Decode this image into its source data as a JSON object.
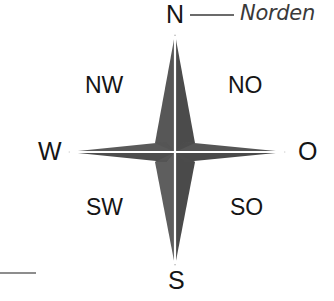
{
  "figure": {
    "kind": "compass-rose",
    "language": "de",
    "background_color": "#ffffff",
    "star": {
      "fill_dark": "#4f4f4f",
      "fill_light": "#6a6a6a",
      "center_x": 175,
      "center_y": 152,
      "tip_north_y": 34,
      "tip_south_y": 266,
      "tip_west_x": 68,
      "tip_east_x": 286,
      "points": 4
    },
    "cardinal_labels": [
      {
        "key": "north",
        "text": "N",
        "degrees": 0
      },
      {
        "key": "east",
        "text": "O",
        "degrees": 90
      },
      {
        "key": "south",
        "text": "S",
        "degrees": 180
      },
      {
        "key": "west",
        "text": "W",
        "degrees": 270
      }
    ],
    "ordinal_labels": [
      {
        "key": "northwest",
        "text": "NW",
        "degrees": 315
      },
      {
        "key": "northeast",
        "text": "NO",
        "degrees": 45
      },
      {
        "key": "southwest",
        "text": "SW",
        "degrees": 225
      },
      {
        "key": "southeast",
        "text": "SO",
        "degrees": 135
      }
    ],
    "annotation": {
      "text": "Norden",
      "leader_color": "#6b6b6b",
      "text_color": "#3a3a3a"
    },
    "corner_mark": {
      "color": "#8d8d8d"
    }
  }
}
